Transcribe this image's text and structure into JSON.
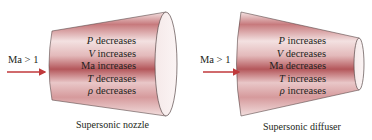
{
  "colors": {
    "body_light": "#f6e7e7",
    "body_dark": "#b85a5e",
    "arrow": "#c0393b",
    "outline": "#5a4a4a",
    "text": "#231f20"
  },
  "nozzle": {
    "inlet_label": "Ma > 1",
    "properties": [
      {
        "symbol": "P",
        "text": " decreases"
      },
      {
        "symbol": "V",
        "text": " increases"
      },
      {
        "symbol": "",
        "text": "Ma increases"
      },
      {
        "symbol": "T",
        "text": " decreases"
      },
      {
        "symbol": "ρ",
        "text": " decreases"
      }
    ],
    "caption": "Supersonic nozzle"
  },
  "diffuser": {
    "inlet_label": "Ma > 1",
    "properties": [
      {
        "symbol": "P",
        "text": " increases"
      },
      {
        "symbol": "V",
        "text": " decreases"
      },
      {
        "symbol": "",
        "text": "Ma decreases"
      },
      {
        "symbol": "T",
        "text": " increases"
      },
      {
        "symbol": "ρ",
        "text": " increases"
      }
    ],
    "caption": "Supersonic diffuser"
  }
}
